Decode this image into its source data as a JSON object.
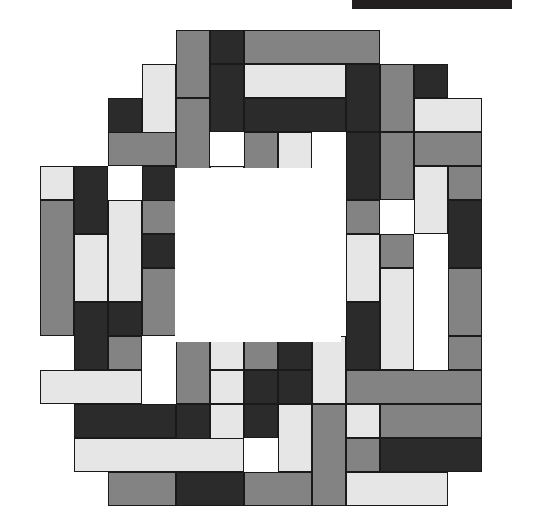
{
  "figure": {
    "background_color": "#ffffff",
    "outline_color": "#1a1a1a",
    "canvas_width": 536,
    "canvas_height": 532
  },
  "top_bar": {
    "name": "cropped-black-bar",
    "color": "#231f20",
    "x": 352,
    "y": 0,
    "width": 160,
    "height": 9
  },
  "palette": {
    "light": "#e6e6e6",
    "medium": "#838383",
    "dark": "#2b2b2b",
    "hole": "#ffffff"
  },
  "grid": {
    "origin_x": 40,
    "origin_y": 30,
    "cell": 34,
    "cols": 13.5,
    "rows": 14
  },
  "hole": {
    "x": 175,
    "y": 168,
    "width": 166,
    "height": 174
  },
  "chart_data": {
    "type": "heatmap",
    "xlabel": "",
    "ylabel": "",
    "legend": [
      "light",
      "medium",
      "dark"
    ],
    "tiles": [
      {
        "x": 176,
        "y": 30,
        "w": 34,
        "h": 68,
        "c": "medium"
      },
      {
        "x": 210,
        "y": 30,
        "w": 34,
        "h": 34,
        "c": "dark"
      },
      {
        "x": 244,
        "y": 30,
        "w": 136,
        "h": 34,
        "c": "medium"
      },
      {
        "x": 142,
        "y": 64,
        "w": 34,
        "h": 102,
        "c": "light"
      },
      {
        "x": 210,
        "y": 64,
        "w": 34,
        "h": 68,
        "c": "dark"
      },
      {
        "x": 244,
        "y": 64,
        "w": 102,
        "h": 34,
        "c": "light"
      },
      {
        "x": 346,
        "y": 64,
        "w": 34,
        "h": 68,
        "c": "dark"
      },
      {
        "x": 380,
        "y": 64,
        "w": 68,
        "h": 34,
        "c": "light"
      },
      {
        "x": 414,
        "y": 64,
        "w": 34,
        "h": 34,
        "c": "dark"
      },
      {
        "x": 380,
        "y": 64,
        "w": 34,
        "h": 68,
        "c": "medium"
      },
      {
        "x": 108,
        "y": 98,
        "w": 34,
        "h": 68,
        "c": "dark"
      },
      {
        "x": 176,
        "y": 98,
        "w": 34,
        "h": 102,
        "c": "medium"
      },
      {
        "x": 244,
        "y": 98,
        "w": 102,
        "h": 34,
        "c": "dark"
      },
      {
        "x": 414,
        "y": 98,
        "w": 68,
        "h": 34,
        "c": "light"
      },
      {
        "x": 108,
        "y": 132,
        "w": 68,
        "h": 34,
        "c": "medium"
      },
      {
        "x": 244,
        "y": 132,
        "w": 34,
        "h": 68,
        "c": "medium"
      },
      {
        "x": 278,
        "y": 132,
        "w": 34,
        "h": 102,
        "c": "light"
      },
      {
        "x": 346,
        "y": 132,
        "w": 34,
        "h": 68,
        "c": "dark"
      },
      {
        "x": 380,
        "y": 132,
        "w": 34,
        "h": 68,
        "c": "medium"
      },
      {
        "x": 414,
        "y": 132,
        "w": 68,
        "h": 34,
        "c": "medium"
      },
      {
        "x": 40,
        "y": 166,
        "w": 34,
        "h": 34,
        "c": "light"
      },
      {
        "x": 74,
        "y": 166,
        "w": 34,
        "h": 68,
        "c": "dark"
      },
      {
        "x": 142,
        "y": 166,
        "w": 34,
        "h": 68,
        "c": "dark"
      },
      {
        "x": 210,
        "y": 166,
        "w": 34,
        "h": 34,
        "c": "light"
      },
      {
        "x": 414,
        "y": 166,
        "w": 34,
        "h": 68,
        "c": "light"
      },
      {
        "x": 448,
        "y": 166,
        "w": 34,
        "h": 34,
        "c": "medium"
      },
      {
        "x": 40,
        "y": 200,
        "w": 34,
        "h": 136,
        "c": "medium"
      },
      {
        "x": 108,
        "y": 200,
        "w": 34,
        "h": 102,
        "c": "light"
      },
      {
        "x": 142,
        "y": 200,
        "w": 34,
        "h": 34,
        "c": "medium"
      },
      {
        "x": 346,
        "y": 200,
        "w": 34,
        "h": 34,
        "c": "medium"
      },
      {
        "x": 448,
        "y": 200,
        "w": 34,
        "h": 68,
        "c": "dark"
      },
      {
        "x": 74,
        "y": 234,
        "w": 34,
        "h": 68,
        "c": "light"
      },
      {
        "x": 142,
        "y": 234,
        "w": 34,
        "h": 34,
        "c": "dark"
      },
      {
        "x": 346,
        "y": 234,
        "w": 34,
        "h": 68,
        "c": "light"
      },
      {
        "x": 380,
        "y": 234,
        "w": 34,
        "h": 34,
        "c": "medium"
      },
      {
        "x": 142,
        "y": 268,
        "w": 34,
        "h": 68,
        "c": "medium"
      },
      {
        "x": 380,
        "y": 268,
        "w": 34,
        "h": 102,
        "c": "light"
      },
      {
        "x": 448,
        "y": 268,
        "w": 34,
        "h": 68,
        "c": "medium"
      },
      {
        "x": 74,
        "y": 302,
        "w": 34,
        "h": 68,
        "c": "dark"
      },
      {
        "x": 108,
        "y": 302,
        "w": 34,
        "h": 34,
        "c": "dark"
      },
      {
        "x": 346,
        "y": 302,
        "w": 34,
        "h": 68,
        "c": "dark"
      },
      {
        "x": 108,
        "y": 336,
        "w": 34,
        "h": 34,
        "c": "medium"
      },
      {
        "x": 176,
        "y": 336,
        "w": 34,
        "h": 68,
        "c": "medium"
      },
      {
        "x": 210,
        "y": 336,
        "w": 34,
        "h": 34,
        "c": "light"
      },
      {
        "x": 244,
        "y": 336,
        "w": 34,
        "h": 34,
        "c": "medium"
      },
      {
        "x": 278,
        "y": 336,
        "w": 34,
        "h": 34,
        "c": "dark"
      },
      {
        "x": 312,
        "y": 336,
        "w": 34,
        "h": 68,
        "c": "light"
      },
      {
        "x": 448,
        "y": 336,
        "w": 34,
        "h": 34,
        "c": "medium"
      },
      {
        "x": 40,
        "y": 370,
        "w": 102,
        "h": 34,
        "c": "light"
      },
      {
        "x": 210,
        "y": 370,
        "w": 34,
        "h": 34,
        "c": "light"
      },
      {
        "x": 244,
        "y": 370,
        "w": 34,
        "h": 34,
        "c": "dark"
      },
      {
        "x": 278,
        "y": 370,
        "w": 34,
        "h": 34,
        "c": "dark"
      },
      {
        "x": 346,
        "y": 370,
        "w": 136,
        "h": 34,
        "c": "medium"
      },
      {
        "x": 74,
        "y": 404,
        "w": 102,
        "h": 34,
        "c": "dark"
      },
      {
        "x": 176,
        "y": 404,
        "w": 34,
        "h": 68,
        "c": "dark"
      },
      {
        "x": 210,
        "y": 404,
        "w": 34,
        "h": 68,
        "c": "light"
      },
      {
        "x": 244,
        "y": 404,
        "w": 34,
        "h": 34,
        "c": "dark"
      },
      {
        "x": 278,
        "y": 404,
        "w": 34,
        "h": 68,
        "c": "light"
      },
      {
        "x": 312,
        "y": 404,
        "w": 34,
        "h": 102,
        "c": "medium"
      },
      {
        "x": 346,
        "y": 404,
        "w": 34,
        "h": 34,
        "c": "light"
      },
      {
        "x": 380,
        "y": 404,
        "w": 102,
        "h": 34,
        "c": "medium"
      },
      {
        "x": 74,
        "y": 438,
        "w": 170,
        "h": 34,
        "c": "light"
      },
      {
        "x": 346,
        "y": 438,
        "w": 34,
        "h": 34,
        "c": "medium"
      },
      {
        "x": 380,
        "y": 438,
        "w": 102,
        "h": 34,
        "c": "dark"
      },
      {
        "x": 108,
        "y": 472,
        "w": 68,
        "h": 34,
        "c": "medium"
      },
      {
        "x": 176,
        "y": 472,
        "w": 68,
        "h": 34,
        "c": "dark"
      },
      {
        "x": 244,
        "y": 472,
        "w": 68,
        "h": 34,
        "c": "medium"
      },
      {
        "x": 346,
        "y": 472,
        "w": 102,
        "h": 34,
        "c": "light"
      },
      {
        "x": 40,
        "y": 166,
        "w": 34,
        "h": 0,
        "c": "light"
      }
    ]
  }
}
